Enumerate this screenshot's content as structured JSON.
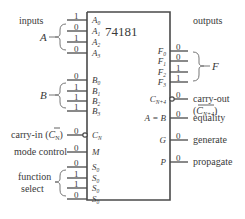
{
  "chip": {
    "name": "74181"
  },
  "headers": {
    "inputs": "inputs",
    "outputs": "outputs"
  },
  "groups": {
    "A": "A",
    "B": "B",
    "F": "F",
    "function_select": [
      "function",
      "select"
    ]
  },
  "left_pins": [
    {
      "id": "A0",
      "label": "A",
      "sub": "0",
      "value": "1",
      "y": 20
    },
    {
      "id": "A1",
      "label": "A",
      "sub": "1",
      "value": "0",
      "y": 31
    },
    {
      "id": "A2",
      "label": "A",
      "sub": "2",
      "value": "1",
      "y": 42
    },
    {
      "id": "A3",
      "label": "A",
      "sub": "3",
      "value": "0",
      "y": 53
    },
    {
      "id": "B0",
      "label": "B",
      "sub": "0",
      "value": "0",
      "y": 80
    },
    {
      "id": "B1",
      "label": "B",
      "sub": "1",
      "value": "1",
      "y": 91
    },
    {
      "id": "B2",
      "label": "B",
      "sub": "2",
      "value": "1",
      "y": 101
    },
    {
      "id": "B3",
      "label": "B",
      "sub": "3",
      "value": "1",
      "y": 111
    },
    {
      "id": "CN",
      "label": "C",
      "sub": "N",
      "value": "0",
      "y": 135,
      "inverted": true
    },
    {
      "id": "M",
      "label": "M",
      "sub": "",
      "value": "0",
      "y": 152
    },
    {
      "id": "S0a",
      "label": "S",
      "sub": "0",
      "value": "0",
      "y": 167
    },
    {
      "id": "S0b",
      "label": "S",
      "sub": "0",
      "value": "1",
      "y": 178
    },
    {
      "id": "S0c",
      "label": "S",
      "sub": "0",
      "value": "1",
      "y": 188
    },
    {
      "id": "S0d",
      "label": "S",
      "sub": "0",
      "value": "0",
      "y": 199
    }
  ],
  "left_labels": {
    "carry_in": "carry-in (",
    "carry_in_sym": "C",
    "carry_in_sub": "N",
    "carry_in_close": ")",
    "mode_control": "mode control"
  },
  "right_pins": [
    {
      "id": "F0",
      "label": "F",
      "sub": "0",
      "value": "0",
      "y": 51
    },
    {
      "id": "F1",
      "label": "F",
      "sub": "1",
      "value": "0",
      "y": 61
    },
    {
      "id": "F2",
      "label": "F",
      "sub": "2",
      "value": "1",
      "y": 72
    },
    {
      "id": "F3",
      "label": "F",
      "sub": "3",
      "value": "1",
      "y": 82
    },
    {
      "id": "CN4",
      "label": "C",
      "sub": "N+4",
      "value": "0",
      "y": 99,
      "inverted": true
    },
    {
      "id": "AeqB",
      "label": "A = B",
      "sub": "",
      "value": "0",
      "y": 118
    },
    {
      "id": "G",
      "label": "G",
      "sub": "",
      "value": "0",
      "y": 140
    },
    {
      "id": "P",
      "label": "P",
      "sub": "",
      "value": "0",
      "y": 162
    }
  ],
  "right_labels": {
    "carry_out": "carry-out",
    "carry_out_sym": "C",
    "carry_out_sub": "N+4",
    "equality": "equality",
    "generate": "generate",
    "propagate": "propagate"
  }
}
